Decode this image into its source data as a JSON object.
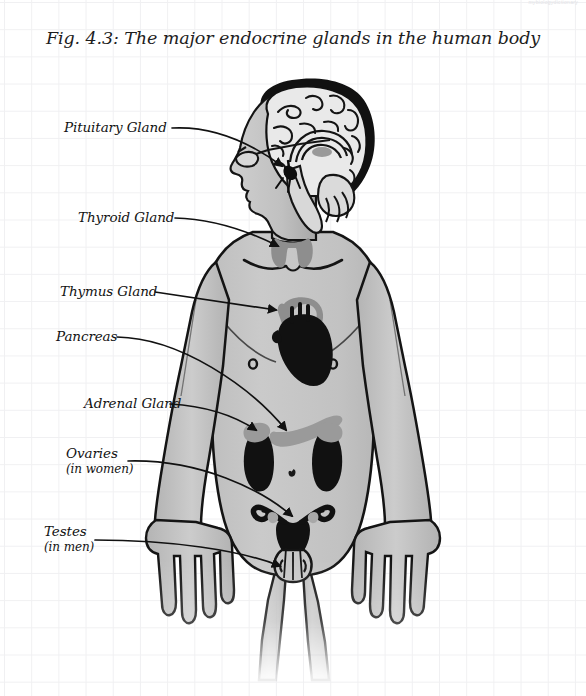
{
  "figure": {
    "title": "Fig. 4.3: The major endocrine glands in the human body",
    "corner_note": "mybiologydictionary",
    "background": "graph-paper"
  },
  "labels": [
    {
      "id": "pituitary",
      "text": "Pituitary Gland",
      "sub": ""
    },
    {
      "id": "thyroid",
      "text": "Thyroid Gland",
      "sub": ""
    },
    {
      "id": "thymus",
      "text": "Thymus Gland",
      "sub": ""
    },
    {
      "id": "pancreas",
      "text": "Pancreas",
      "sub": ""
    },
    {
      "id": "adrenal",
      "text": "Adrenal Gland",
      "sub": ""
    },
    {
      "id": "ovaries",
      "text": "Ovaries",
      "sub": "(in women)"
    },
    {
      "id": "testes",
      "text": "Testes",
      "sub": "(in men)"
    }
  ],
  "colors": {
    "page_background": "#ffffff",
    "grid_line": "#f0f0f2",
    "ink": "#111111",
    "body_fill": "#c5c5c5",
    "body_fill_light": "#d6d6d6",
    "body_outline": "#141414",
    "gland_dark": "#111111",
    "gland_mid": "#8f8f8f",
    "gland_light": "#b2b2b2",
    "brain_fill": "#e8e8e8"
  },
  "glands": [
    {
      "id": "pituitary",
      "region": "brain base",
      "shade": "dark"
    },
    {
      "id": "thyroid",
      "region": "neck",
      "shade": "mid"
    },
    {
      "id": "thymus",
      "region": "upper chest",
      "shade": "mid"
    },
    {
      "id": "heart",
      "region": "chest",
      "shade": "dark"
    },
    {
      "id": "pancreas",
      "region": "upper abdomen",
      "shade": "mid"
    },
    {
      "id": "adrenal",
      "region": "atop kidneys",
      "shade": "mid"
    },
    {
      "id": "kidney",
      "region": "abdomen",
      "shade": "dark"
    },
    {
      "id": "ovaries",
      "region": "pelvis",
      "shade": "mid"
    },
    {
      "id": "uterus",
      "region": "pelvis",
      "shade": "dark"
    },
    {
      "id": "testes",
      "region": "groin",
      "shade": "dark"
    }
  ]
}
